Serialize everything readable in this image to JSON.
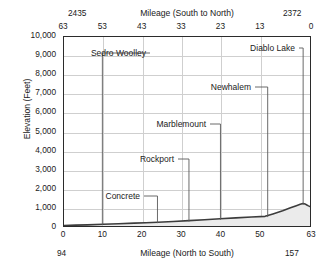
{
  "chart_data": {
    "type": "area",
    "title": "",
    "subtitle": "",
    "xlabel_top": "Mileage (South to North)",
    "xlabel_bottom": "Mileage (North to South)",
    "ylabel": "Elevation (Feet)",
    "ylim": [
      0,
      10000
    ],
    "xlim": [
      0,
      63
    ],
    "grid": true,
    "legend": "none",
    "y_ticks": [
      "10,000",
      "9,000",
      "8,000",
      "7,000",
      "6,000",
      "5,000",
      "4,000",
      "3,000",
      "2,000",
      "1,000",
      "0"
    ],
    "y_tick_values": [
      10000,
      9000,
      8000,
      7000,
      6000,
      5000,
      4000,
      3000,
      2000,
      1000,
      0
    ],
    "x_ticks_top": [
      "63",
      "53",
      "43",
      "33",
      "23",
      "13",
      "0"
    ],
    "x_tick_values_top": [
      63,
      53,
      43,
      33,
      23,
      13,
      0
    ],
    "x_ticks_bottom": [
      "0",
      "10",
      "20",
      "30",
      "40",
      "50",
      "63"
    ],
    "x_tick_values_bottom": [
      0,
      10,
      20,
      30,
      40,
      50,
      63
    ],
    "corner_labels": {
      "top_left": "2435",
      "top_right": "2372",
      "bottom_left": "94",
      "bottom_right": "157"
    },
    "series": [
      {
        "name": "Elevation profile",
        "x": [
          0,
          3,
          6,
          10,
          14,
          18,
          21,
          24,
          28,
          32,
          36,
          40,
          44,
          48,
          51.5,
          53.5,
          56,
          58,
          59.5,
          60.5,
          61.2,
          61.8,
          62.2,
          62.6,
          63
        ],
        "values": [
          30,
          45,
          60,
          90,
          120,
          150,
          175,
          200,
          240,
          285,
          330,
          380,
          430,
          480,
          510,
          640,
          810,
          960,
          1075,
          1145,
          1185,
          1160,
          1110,
          1065,
          1030
        ]
      }
    ],
    "annotations": [
      {
        "label": "Sedro Woolley",
        "x": 10,
        "elevation": 90
      },
      {
        "label": "Concrete",
        "x": 24,
        "elevation": 200
      },
      {
        "label": "Rockport",
        "x": 32,
        "elevation": 285
      },
      {
        "label": "Marblemount",
        "x": 40,
        "elevation": 380
      },
      {
        "label": "Newhalem",
        "x": 52,
        "elevation": 520
      },
      {
        "label": "Diablo Lake",
        "x": 61,
        "elevation": 1180
      }
    ],
    "colors": {
      "line": "#3c3c3c",
      "fill": "#ebebeb",
      "grid": "#cfcfcf",
      "frame": "#2b2b2b",
      "text": "#1a1a1a",
      "background": "#ffffff"
    }
  }
}
